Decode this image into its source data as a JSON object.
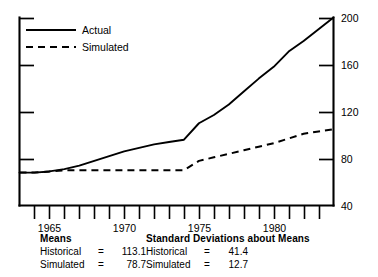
{
  "chart_data": {
    "type": "line",
    "title": "",
    "subtitle": "",
    "xlabel": "",
    "ylabel": "",
    "xlim": [
      1963.0,
      1984.0
    ],
    "ylim": [
      40,
      200
    ],
    "grid": false,
    "legend_position": "top-left",
    "yticks": [
      40,
      80,
      120,
      160,
      200
    ],
    "ytick_labels": [
      "40",
      "80",
      "120",
      "160",
      "200"
    ],
    "xticks": [
      1964,
      1965,
      1966,
      1967,
      1968,
      1969,
      1970,
      1971,
      1972,
      1973,
      1974,
      1975,
      1976,
      1977,
      1978,
      1979,
      1980,
      1981,
      1982,
      1983
    ],
    "xtick_labels_shown": [
      "1965",
      "1970",
      "1975",
      "1980"
    ],
    "xtick_labels_at": [
      1965,
      1970,
      1975,
      1980
    ],
    "x": [
      1963,
      1964,
      1965,
      1966,
      1967,
      1968,
      1969,
      1970,
      1971,
      1972,
      1973,
      1974,
      1975,
      1976,
      1977,
      1978,
      1979,
      1980,
      1981,
      1982,
      1983,
      1984
    ],
    "series": [
      {
        "name": "Actual",
        "style": "solid",
        "values": [
          68,
          68,
          69,
          71,
          74,
          78,
          82,
          86,
          89,
          92,
          94,
          96,
          110,
          117,
          126,
          137,
          148,
          158,
          171,
          180,
          190,
          200
        ]
      },
      {
        "name": "Simulated",
        "style": "dashed",
        "values": [
          68,
          68,
          69,
          70,
          70,
          70,
          70,
          70,
          70,
          70,
          70,
          70,
          78,
          81,
          84,
          87,
          90,
          93,
          97,
          101,
          103,
          105
        ]
      }
    ]
  },
  "legend": {
    "entries": [
      {
        "label": "Actual",
        "style": "solid"
      },
      {
        "label": "Simulated",
        "style": "dashed"
      }
    ]
  },
  "stats": {
    "left": {
      "heading": "Means",
      "rows": [
        {
          "name": "Historical",
          "eq": "=",
          "value": "113.1"
        },
        {
          "name": "Simulated",
          "eq": "=",
          "value": "78.7"
        }
      ]
    },
    "right": {
      "heading": "Standard Deviations about Means",
      "rows": [
        {
          "name": "Historical",
          "eq": "=",
          "value": "41.4"
        },
        {
          "name": "Simulated",
          "eq": "=",
          "value": "12.7"
        }
      ]
    }
  },
  "colors": {
    "ink": "#000000",
    "background": "#ffffff"
  }
}
